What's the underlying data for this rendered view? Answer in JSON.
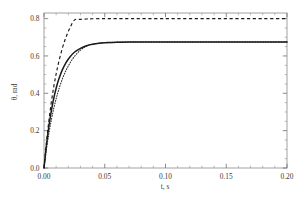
{
  "chart_data": {
    "type": "line",
    "title": "",
    "subtitle": "",
    "xlabel": "t, s",
    "ylabel": "θ, rad",
    "xlim": [
      0.0,
      0.2
    ],
    "ylim": [
      0.0,
      0.83
    ],
    "grid": false,
    "legend": "none",
    "x_ticks": [
      0.0,
      0.05,
      0.1,
      0.15,
      0.2
    ],
    "x_tick_labels": [
      "0.00",
      "0.05",
      "0.10",
      "0.15",
      "0.20"
    ],
    "x_minor_step": 0.01,
    "y_ticks": [
      0.0,
      0.2,
      0.4,
      0.6,
      0.8
    ],
    "y_tick_labels": [
      "0.0",
      "0.2",
      "0.4",
      "0.6",
      "0.8"
    ],
    "y_minor_step": 0.05,
    "series": [
      {
        "name": "dashed-curve",
        "style": "dashed",
        "color": "#1a1a1a",
        "plateau": 0.8,
        "time_constant": 0.0105,
        "x": [
          0.0,
          0.002,
          0.004,
          0.006,
          0.008,
          0.01,
          0.012,
          0.015,
          0.018,
          0.021,
          0.025,
          0.03,
          0.035,
          0.04,
          0.05,
          0.06,
          0.07,
          0.08,
          0.1,
          0.12,
          0.14,
          0.16,
          0.18,
          0.2
        ],
        "values": [
          0.0,
          0.137,
          0.253,
          0.351,
          0.434,
          0.504,
          0.564,
          0.639,
          0.699,
          0.745,
          0.792,
          0.796,
          0.798,
          0.799,
          0.8,
          0.8,
          0.8,
          0.8,
          0.8,
          0.8,
          0.8,
          0.8,
          0.8,
          0.8
        ]
      },
      {
        "name": "solid-curve",
        "style": "solid",
        "color": "#1a1a1a",
        "plateau": 0.675,
        "time_constant": 0.01,
        "x": [
          0.0,
          0.002,
          0.004,
          0.006,
          0.008,
          0.01,
          0.012,
          0.015,
          0.018,
          0.021,
          0.025,
          0.03,
          0.035,
          0.04,
          0.05,
          0.06,
          0.07,
          0.08,
          0.1,
          0.12,
          0.14,
          0.16,
          0.18,
          0.2
        ],
        "values": [
          0.0,
          0.122,
          0.223,
          0.305,
          0.372,
          0.427,
          0.472,
          0.524,
          0.563,
          0.592,
          0.62,
          0.641,
          0.655,
          0.663,
          0.671,
          0.673,
          0.675,
          0.675,
          0.675,
          0.675,
          0.675,
          0.675,
          0.675,
          0.675
        ]
      },
      {
        "name": "dotted-curve",
        "style": "dotted",
        "color": "#2a2a2a",
        "plateau": 0.675,
        "time_constant": 0.0128,
        "x": [
          0.0,
          0.002,
          0.004,
          0.006,
          0.008,
          0.01,
          0.012,
          0.015,
          0.018,
          0.021,
          0.025,
          0.03,
          0.035,
          0.04,
          0.05,
          0.06,
          0.07,
          0.08,
          0.1,
          0.12,
          0.14,
          0.16,
          0.18,
          0.2
        ],
        "values": [
          0.0,
          0.099,
          0.184,
          0.256,
          0.318,
          0.371,
          0.417,
          0.475,
          0.521,
          0.558,
          0.597,
          0.631,
          0.653,
          0.663,
          0.672,
          0.674,
          0.675,
          0.675,
          0.675,
          0.675,
          0.675,
          0.675,
          0.675,
          0.675
        ]
      }
    ]
  }
}
